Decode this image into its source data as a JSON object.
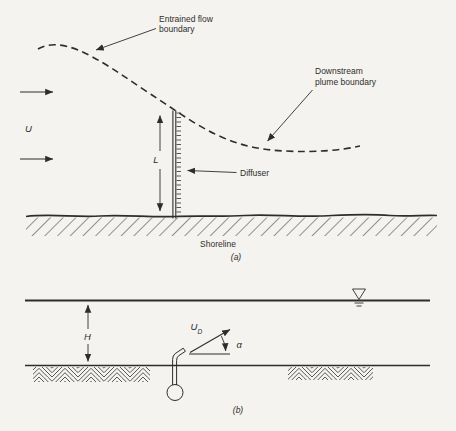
{
  "colors": {
    "line": "#2e2d2b",
    "background": "#f4f3ef",
    "text": "#2e2d2b"
  },
  "part_a": {
    "caption": "(a)",
    "labels": {
      "entrained_flow_line1": "Entrained flow",
      "entrained_flow_line2": "boundary",
      "downstream_line1": "Downstream",
      "downstream_line2": "plume boundary",
      "diffuser": "Diffuser",
      "shoreline": "Shoreline",
      "ambient_velocity": "U",
      "diffuser_length": "L"
    }
  },
  "part_b": {
    "caption": "(b)",
    "labels": {
      "water_depth": "H",
      "discharge_velocity_main": "U",
      "discharge_velocity_sub": "D",
      "discharge_angle": "α"
    }
  },
  "icons": {
    "water_level": "inverted-open-triangle-with-hatches",
    "arrowhead": "filled-triangle"
  }
}
